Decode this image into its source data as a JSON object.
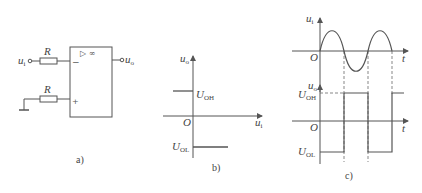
{
  "figure_a": {
    "caption": "a)",
    "input_label": "u",
    "input_sub": "i",
    "output_label": "u",
    "output_sub": "o",
    "resistor1_label": "R",
    "resistor2_label": "R",
    "amp_symbol": "▷ ∞",
    "minus_sign": "−",
    "plus_sign": "+"
  },
  "figure_b": {
    "caption": "b)",
    "y_axis_label": "u",
    "y_axis_sub": "o",
    "x_axis_label": "u",
    "x_axis_sub": "i",
    "origin": "O",
    "high_label": "U",
    "high_sub": "OH",
    "low_label": "U",
    "low_sub": "OL"
  },
  "figure_c": {
    "caption": "c)",
    "top_y_label": "u",
    "top_y_sub": "i",
    "top_x_label": "t",
    "top_origin": "O",
    "bottom_y_label": "u",
    "bottom_y_sub": "o",
    "bottom_x_label": "t",
    "bottom_origin": "O",
    "high_label": "U",
    "high_sub": "OH",
    "low_label": "U",
    "low_sub": "OL"
  }
}
